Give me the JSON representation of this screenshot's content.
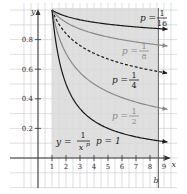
{
  "chart_data": {
    "type": "line",
    "title": "",
    "xlabel": "x",
    "ylabel": "y",
    "xlim": [
      0,
      9.5
    ],
    "ylim": [
      0,
      1.0
    ],
    "grid": true,
    "x_ticks": [
      "1",
      "2",
      "3",
      "4",
      "5",
      "6",
      "7",
      "8",
      "9"
    ],
    "y_ticks": [
      "0.2",
      "0.4",
      "0.6",
      "0.8"
    ],
    "shaded_region": {
      "x_from": 1,
      "x_to": "b",
      "b_value": 8.6,
      "label": "b"
    },
    "formula_label": {
      "lhs": "y =",
      "numerator": "1",
      "denominator": "x",
      "exponent": "p"
    },
    "series": [
      {
        "name": "p = 1/16",
        "p": 0.0625,
        "style": "solid",
        "color": "#1a1a1a",
        "label_num": "1",
        "label_den": "16",
        "x": [
          1,
          2,
          3,
          4,
          5,
          6,
          7,
          8,
          9
        ],
        "values": [
          1.0,
          0.958,
          0.934,
          0.917,
          0.904,
          0.894,
          0.885,
          0.878,
          0.872
        ]
      },
      {
        "name": "p = 1/8",
        "p": 0.125,
        "style": "solid",
        "color": "#8a8a8a",
        "label_num": "1",
        "label_den": "8",
        "x": [
          1,
          2,
          3,
          4,
          5,
          6,
          7,
          8,
          9
        ],
        "values": [
          1.0,
          0.917,
          0.872,
          0.841,
          0.818,
          0.799,
          0.784,
          0.771,
          0.76
        ]
      },
      {
        "name": "p = 1/4",
        "p": 0.25,
        "style": "dashed",
        "color": "#1a1a1a",
        "label_num": "1",
        "label_den": "4",
        "x": [
          1,
          2,
          3,
          4,
          5,
          6,
          7,
          8,
          9
        ],
        "values": [
          1.0,
          0.841,
          0.76,
          0.707,
          0.669,
          0.639,
          0.615,
          0.595,
          0.577
        ]
      },
      {
        "name": "p = 1/2",
        "p": 0.5,
        "style": "solid",
        "color": "#8a8a8a",
        "label_num": "1",
        "label_den": "2",
        "x": [
          1,
          2,
          3,
          4,
          5,
          6,
          7,
          8,
          9
        ],
        "values": [
          1.0,
          0.707,
          0.577,
          0.5,
          0.447,
          0.408,
          0.378,
          0.354,
          0.333
        ]
      },
      {
        "name": "p = 1",
        "p": 1,
        "style": "solid",
        "color": "#1a1a1a",
        "label_text": "p = 1",
        "x": [
          1,
          2,
          3,
          4,
          5,
          6,
          7,
          8,
          9
        ],
        "values": [
          1.0,
          0.5,
          0.333,
          0.25,
          0.2,
          0.167,
          0.143,
          0.125,
          0.111
        ]
      }
    ],
    "labels": {
      "p_eq": "p =",
      "p1": "p = 1",
      "b": "b",
      "x_axis": "x",
      "y_axis": "y"
    },
    "colors": {
      "grid": "#c8c8c8",
      "shade": "#d9d9d9",
      "axis": "#333333",
      "dark": "#1a1a1a",
      "gray": "#8a8a8a"
    }
  }
}
